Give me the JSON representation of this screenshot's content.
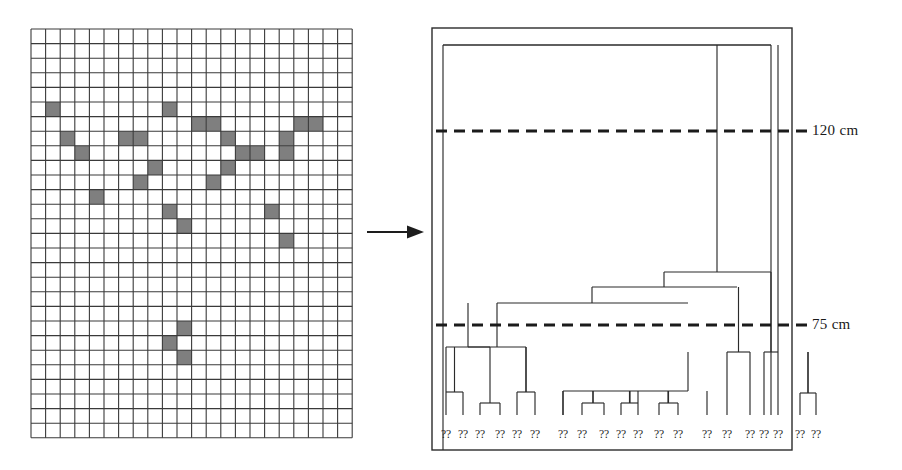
{
  "figure": {
    "type": "diagram",
    "background_color": "#ffffff",
    "ink_color": "#2b2b2b",
    "cell_fill_color": "#808080"
  },
  "grid_panel": {
    "name": "presence-absence-grid",
    "columns": 22,
    "rows": 28,
    "x": 31,
    "y": 29,
    "cell_size": 14.6,
    "line_color": "#3a3a3a",
    "fill_color": "#7f7f7f",
    "filled_cells": [
      [
        5,
        1
      ],
      [
        5,
        9
      ],
      [
        6,
        11
      ],
      [
        6,
        12
      ],
      [
        6,
        18
      ],
      [
        6,
        19
      ],
      [
        7,
        2
      ],
      [
        7,
        6
      ],
      [
        7,
        7
      ],
      [
        7,
        13
      ],
      [
        7,
        17
      ],
      [
        8,
        3
      ],
      [
        8,
        14
      ],
      [
        8,
        15
      ],
      [
        8,
        17
      ],
      [
        9,
        8
      ],
      [
        9,
        13
      ],
      [
        10,
        7
      ],
      [
        10,
        12
      ],
      [
        11,
        4
      ],
      [
        12,
        9
      ],
      [
        12,
        16
      ],
      [
        13,
        10
      ],
      [
        14,
        17
      ],
      [
        20,
        10
      ],
      [
        21,
        9
      ],
      [
        22,
        10
      ]
    ]
  },
  "arrow": {
    "name": "transform-arrow",
    "x1": 367,
    "y1": 232,
    "x2": 424,
    "y2": 232,
    "direction": "right"
  },
  "dendrogram_panel": {
    "name": "dendrogram",
    "box": {
      "x": 432,
      "y": 28,
      "width": 360,
      "height": 422
    },
    "leaf_count": 20,
    "leaf_label": "??",
    "leaf_labels": [
      "??",
      "??",
      "??",
      "??",
      "??",
      "??",
      "??",
      "??",
      "??",
      "??",
      "??",
      "??",
      "??",
      "??",
      "??",
      "??",
      "??",
      "??",
      "??",
      "??"
    ],
    "cut_lines": [
      {
        "name": "cut-line-120",
        "label": "120 cm",
        "y": 131,
        "dash": "11 7"
      },
      {
        "name": "cut-line-75",
        "label": "75 cm",
        "y": 325,
        "dash": "11 7"
      }
    ],
    "cut_label_x": 812,
    "leaf_y": 415,
    "label_y": 438,
    "leaf_x": [
      446,
      463,
      480,
      500,
      517,
      535,
      563,
      582,
      604,
      621,
      638,
      659,
      678,
      707,
      727,
      750,
      764,
      778,
      800,
      816
    ],
    "merges": [
      {
        "name": "m1",
        "x1": 446,
        "x2": 463,
        "y": 392
      },
      {
        "name": "m2",
        "x1": 480,
        "x2": 500,
        "y": 403
      },
      {
        "name": "m3",
        "x1": 517,
        "x2": 535,
        "y": 392
      },
      {
        "name": "m4",
        "x1": 454,
        "x2": 490,
        "y": 347
      },
      {
        "name": "m5",
        "x1": 472,
        "x2": 526,
        "y": 347
      },
      {
        "name": "m6",
        "x1": 463,
        "x2": 499,
        "y": 347
      },
      {
        "name": "m7",
        "x1": 582,
        "x2": 604,
        "y": 403
      },
      {
        "name": "m8",
        "x1": 621,
        "x2": 638,
        "y": 403
      },
      {
        "name": "m9",
        "x1": 659,
        "x2": 678,
        "y": 403
      },
      {
        "name": "m10",
        "x1": 563,
        "x2": 707,
        "y": 391
      },
      {
        "name": "m11",
        "x1": 727,
        "x2": 750,
        "y": 352
      },
      {
        "name": "m12",
        "x1": 764,
        "x2": 778,
        "y": 352
      },
      {
        "name": "m13",
        "x1": 800,
        "x2": 816,
        "y": 393
      },
      {
        "name": "m14",
        "x1": 476,
        "x2": 635,
        "y": 303
      },
      {
        "name": "m15",
        "x1": 555,
        "x2": 688,
        "y": 287
      },
      {
        "name": "m16",
        "x1": 622,
        "x2": 737,
        "y": 272
      },
      {
        "name": "m17",
        "x1": 680,
        "x2": 771,
        "y": 45
      }
    ]
  }
}
